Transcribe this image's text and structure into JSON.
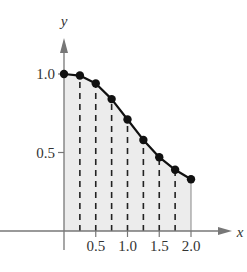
{
  "chart_data": {
    "type": "area",
    "title": "",
    "xlabel": "x",
    "ylabel": "y",
    "x": [
      0,
      0.25,
      0.5,
      0.75,
      1.0,
      1.25,
      1.5,
      1.75,
      2.0
    ],
    "values": [
      1.0,
      0.99,
      0.94,
      0.84,
      0.71,
      0.58,
      0.47,
      0.39,
      0.33
    ],
    "x_ticks": [
      "0.5",
      "1.0",
      "1.5",
      "2.0"
    ],
    "y_ticks": [
      "0.5",
      "1.0"
    ],
    "xlim": [
      0,
      2.2
    ],
    "ylim": [
      0,
      1.1
    ],
    "grid": false,
    "annotations": "dashed vertical lines at each subinterval point; region under curve shaded",
    "colors": {
      "shade": "#ececec",
      "curve": "#111111",
      "axis": "#777777"
    }
  }
}
